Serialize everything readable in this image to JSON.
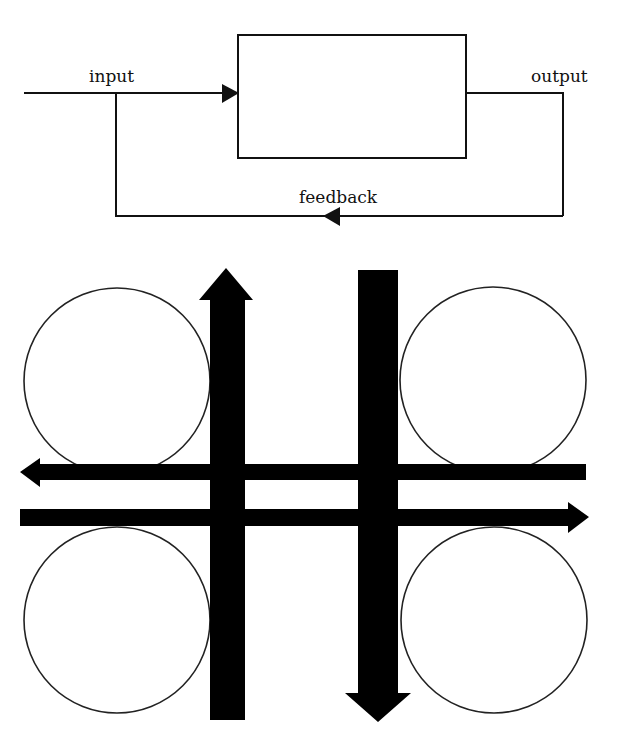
{
  "feedback_diagram": {
    "labels": {
      "input": "input",
      "output": "output",
      "feedback": "feedback"
    },
    "stroke_color": "#111111"
  },
  "traffic_diagram": {
    "circles": [
      {
        "name": "top-left",
        "cx": 117,
        "cy": 381,
        "r": 93
      },
      {
        "name": "top-right",
        "cx": 493,
        "cy": 380,
        "r": 93
      },
      {
        "name": "bottom-left",
        "cx": 117,
        "cy": 620,
        "r": 93
      },
      {
        "name": "bottom-right",
        "cx": 494,
        "cy": 620,
        "r": 93
      }
    ],
    "arrows": [
      {
        "name": "up-arrow",
        "direction": "up"
      },
      {
        "name": "down-arrow",
        "direction": "down"
      },
      {
        "name": "left-arrow",
        "direction": "left"
      },
      {
        "name": "right-arrow",
        "direction": "right"
      }
    ],
    "fill_color": "#000000"
  }
}
